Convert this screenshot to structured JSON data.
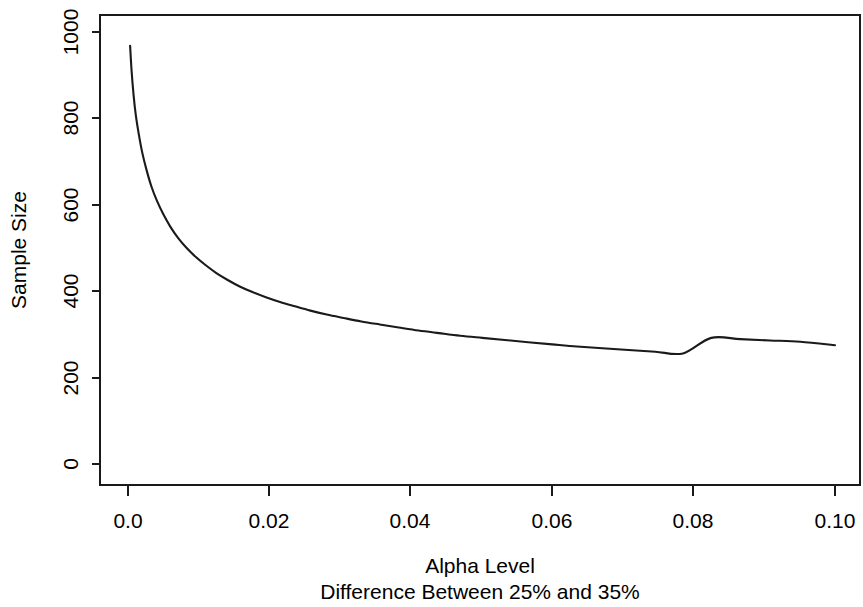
{
  "chart_data": {
    "type": "line",
    "title": "",
    "xlabel": "Alpha Level",
    "sublabel": "Difference Between 25% and 35%",
    "ylabel": "Sample Size",
    "xlim": [
      -0.004,
      0.1045
    ],
    "ylim": [
      0,
      1035
    ],
    "xticks": [
      0.0,
      0.02,
      0.04,
      0.06,
      0.08,
      0.1
    ],
    "xticklabels": [
      "0.0",
      "0.02",
      "0.04",
      "0.06",
      "0.08",
      "0.10"
    ],
    "yticks": [
      0,
      200,
      400,
      600,
      800,
      1000
    ],
    "yticklabels": [
      "0",
      "200",
      "400",
      "600",
      "800",
      "1000"
    ],
    "grid": false,
    "legend": false,
    "line_color": "#1a1a1a",
    "series": [
      {
        "name": "Sample Size",
        "x": [
          0.0003,
          0.0005,
          0.0008,
          0.0011,
          0.0015,
          0.002,
          0.0026,
          0.0033,
          0.0041,
          0.005,
          0.006,
          0.0071,
          0.0083,
          0.0096,
          0.011,
          0.0125,
          0.0141,
          0.0158,
          0.0176,
          0.0195,
          0.0215,
          0.0236,
          0.0258,
          0.0281,
          0.0305,
          0.033,
          0.0356,
          0.0383,
          0.0411,
          0.044,
          0.047,
          0.0501,
          0.0533,
          0.0566,
          0.06,
          0.0635,
          0.0671,
          0.0708,
          0.0746,
          0.0785,
          0.0825,
          0.0866,
          0.0908,
          0.0951,
          0.1
        ],
        "y": [
          968,
          912,
          852,
          808,
          766,
          722,
          682,
          643,
          609,
          578,
          549,
          523,
          500,
          479,
          460,
          442,
          426,
          411,
          398,
          386,
          375,
          365,
          355,
          346,
          338,
          330,
          323,
          316,
          309,
          303,
          297,
          292,
          287,
          282,
          277,
          272,
          268,
          264,
          260,
          256,
          292,
          289,
          286,
          283,
          275
        ]
      }
    ],
    "annotations": []
  },
  "axes": {
    "y_axis_label": "Sample Size",
    "x_axis_label": "Alpha Level",
    "x_axis_sublabel": "Difference Between 25% and 35%"
  }
}
